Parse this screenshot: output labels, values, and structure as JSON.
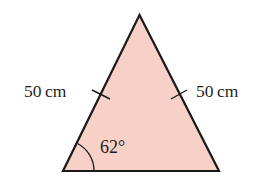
{
  "diagram": {
    "type": "isosceles-triangle",
    "colors": {
      "fill": "#f7d0c7",
      "stroke": "#1a1a1a",
      "text": "#231f20"
    },
    "labels": {
      "left_side": "50 cm",
      "right_side": "50 cm",
      "base_angle": "62°"
    },
    "side_length_value": 50,
    "side_length_unit": "cm",
    "base_angle_value": 62,
    "equal_side_tick_marks": 2
  }
}
